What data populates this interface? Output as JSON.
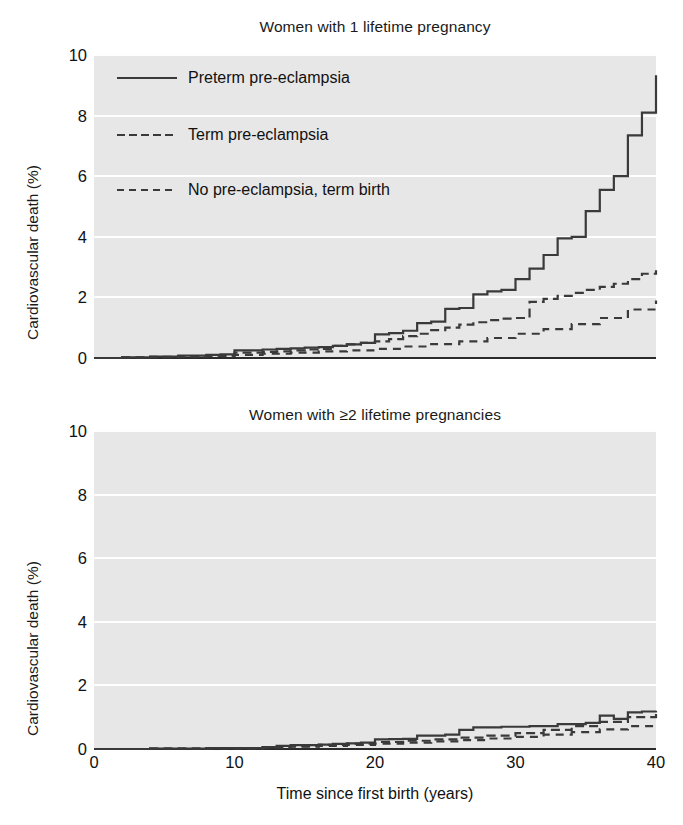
{
  "figure": {
    "xlabel": "Time since first birth (years)",
    "ylabel": "Cardiovascular death (%)",
    "background_color": "#e7e7e7",
    "gridline_color": "#ffffff",
    "line_color": "#3a3a3a"
  },
  "legend": {
    "position": "upper-left-of-top-panel",
    "entries": [
      {
        "label": "Preterm pre-eclampsia",
        "style": "solid",
        "icon": "solid-line-icon"
      },
      {
        "label": "Term pre-eclampsia",
        "style": "dashed-long",
        "icon": "dashed-line-icon"
      },
      {
        "label": "No pre-eclampsia, term birth",
        "style": "dashed-short",
        "icon": "dashed-line-icon"
      }
    ]
  },
  "chart_data": [
    {
      "type": "line",
      "id": "top-panel",
      "title": "Women with 1 lifetime pregnancy",
      "xlabel": "Time since first birth (years)",
      "ylabel": "Cardiovascular death (%)",
      "xlim": [
        0,
        40
      ],
      "ylim": [
        0,
        10
      ],
      "xticks": [
        0,
        10,
        20,
        30,
        40
      ],
      "yticks": [
        0,
        2,
        4,
        6,
        8,
        10
      ],
      "grid": true,
      "step": "post",
      "series": [
        {
          "name": "Preterm pre-eclampsia",
          "style": "solid",
          "x": [
            0,
            2,
            4,
            6,
            8,
            9,
            10,
            11,
            12,
            13,
            14,
            15,
            16,
            17,
            18,
            19,
            20,
            21,
            22,
            23,
            24,
            25,
            26,
            27,
            28,
            29,
            30,
            31,
            32,
            33,
            34,
            35,
            36,
            37,
            38,
            39,
            40
          ],
          "y": [
            0.0,
            0.02,
            0.05,
            0.08,
            0.1,
            0.12,
            0.25,
            0.25,
            0.28,
            0.3,
            0.32,
            0.34,
            0.36,
            0.4,
            0.45,
            0.5,
            0.78,
            0.82,
            0.9,
            1.15,
            1.2,
            1.62,
            1.65,
            2.1,
            2.2,
            2.25,
            2.6,
            2.95,
            3.4,
            3.95,
            4.0,
            4.85,
            5.55,
            6.0,
            7.35,
            8.1,
            9.33
          ]
        },
        {
          "name": "Term pre-eclampsia",
          "style": "dashed-long",
          "x": [
            0,
            2,
            4,
            6,
            8,
            10,
            12,
            13,
            14,
            15,
            16,
            17,
            18,
            19,
            20,
            21,
            22,
            23,
            24,
            25,
            26,
            27,
            28,
            29,
            30,
            31,
            32,
            33,
            34,
            35,
            36,
            37,
            38,
            39,
            40
          ],
          "y": [
            0.0,
            0.02,
            0.04,
            0.06,
            0.08,
            0.18,
            0.2,
            0.22,
            0.25,
            0.28,
            0.3,
            0.4,
            0.45,
            0.5,
            0.55,
            0.62,
            0.72,
            0.8,
            0.92,
            1.0,
            1.1,
            1.18,
            1.25,
            1.3,
            1.32,
            1.85,
            1.95,
            2.05,
            2.15,
            2.25,
            2.35,
            2.45,
            2.6,
            2.78,
            2.9
          ]
        },
        {
          "name": "No pre-eclampsia, term birth",
          "style": "dashed-short",
          "x": [
            0,
            2,
            4,
            6,
            8,
            10,
            12,
            14,
            16,
            18,
            20,
            22,
            24,
            26,
            28,
            30,
            32,
            34,
            36,
            38,
            40
          ],
          "y": [
            0.0,
            0.01,
            0.02,
            0.04,
            0.06,
            0.1,
            0.14,
            0.18,
            0.22,
            0.25,
            0.3,
            0.38,
            0.46,
            0.55,
            0.66,
            0.8,
            0.95,
            1.12,
            1.32,
            1.6,
            1.9
          ]
        }
      ]
    },
    {
      "type": "line",
      "id": "bottom-panel",
      "title": "Women with ≥2 lifetime pregnancies",
      "xlabel": "Time since first birth (years)",
      "ylabel": "Cardiovascular death (%)",
      "xlim": [
        0,
        40
      ],
      "ylim": [
        0,
        10
      ],
      "xticks": [
        0,
        10,
        20,
        30,
        40
      ],
      "yticks": [
        0,
        2,
        4,
        6,
        8,
        10
      ],
      "grid": true,
      "step": "post",
      "series": [
        {
          "name": "Preterm pre-eclampsia",
          "style": "solid",
          "x": [
            0,
            4,
            8,
            12,
            13,
            14,
            16,
            17,
            18,
            19,
            20,
            21,
            22,
            23,
            25,
            26,
            27,
            29,
            31,
            33,
            35,
            36,
            37,
            38,
            39,
            40
          ],
          "y": [
            0.0,
            0.01,
            0.03,
            0.06,
            0.1,
            0.12,
            0.14,
            0.16,
            0.18,
            0.2,
            0.3,
            0.31,
            0.32,
            0.42,
            0.45,
            0.6,
            0.68,
            0.7,
            0.72,
            0.78,
            0.82,
            1.05,
            0.95,
            1.15,
            1.18,
            1.2
          ]
        },
        {
          "name": "Term pre-eclampsia",
          "style": "dashed-long",
          "x": [
            0,
            4,
            8,
            12,
            14,
            16,
            18,
            20,
            22,
            24,
            26,
            28,
            30,
            32,
            34,
            36,
            38,
            40
          ],
          "y": [
            0.0,
            0.01,
            0.02,
            0.05,
            0.09,
            0.13,
            0.17,
            0.22,
            0.26,
            0.3,
            0.36,
            0.42,
            0.5,
            0.6,
            0.72,
            0.85,
            1.0,
            1.15
          ]
        },
        {
          "name": "No pre-eclampsia, term birth",
          "style": "dashed-short",
          "x": [
            0,
            4,
            8,
            12,
            14,
            16,
            18,
            20,
            22,
            24,
            26,
            28,
            30,
            32,
            34,
            36,
            38,
            40
          ],
          "y": [
            0.0,
            0.01,
            0.02,
            0.04,
            0.07,
            0.1,
            0.13,
            0.17,
            0.2,
            0.24,
            0.28,
            0.33,
            0.38,
            0.45,
            0.53,
            0.62,
            0.72,
            0.82
          ]
        }
      ]
    }
  ]
}
